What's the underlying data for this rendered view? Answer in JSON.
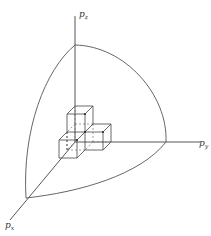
{
  "diagram": {
    "title": "",
    "axes": {
      "z": {
        "label": "p",
        "sub": "z"
      },
      "y": {
        "label": "p",
        "sub": "y"
      },
      "x": {
        "label": "p",
        "sub": "x"
      }
    },
    "colors": {
      "line": "#444444",
      "background": "#ffffff"
    }
  }
}
